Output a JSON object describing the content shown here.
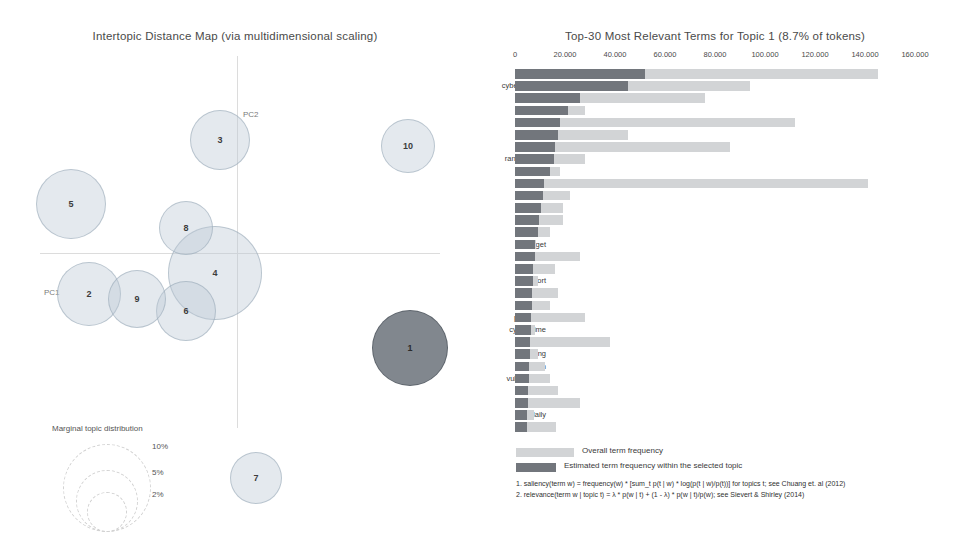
{
  "left": {
    "title": "Intertopic Distance Map (via multidimensional scaling)",
    "axis_labels": {
      "pc1": "PC1",
      "pc2": "PC2"
    },
    "marginal_legend": {
      "title": "Marginal topic distribution",
      "percents": [
        "2%",
        "5%",
        "10%"
      ]
    },
    "topics": [
      {
        "id": "1",
        "label": "1",
        "x": 410,
        "y": 300,
        "r": 38,
        "selected": true
      },
      {
        "id": "2",
        "label": "2",
        "x": 89,
        "y": 246,
        "r": 32,
        "selected": false
      },
      {
        "id": "3",
        "label": "3",
        "x": 220,
        "y": 92,
        "r": 30,
        "selected": false
      },
      {
        "id": "4",
        "label": "4",
        "x": 215,
        "y": 225,
        "r": 47,
        "selected": false
      },
      {
        "id": "5",
        "label": "5",
        "x": 71,
        "y": 156,
        "r": 35,
        "selected": false
      },
      {
        "id": "6",
        "label": "6",
        "x": 186,
        "y": 263,
        "r": 30,
        "selected": false
      },
      {
        "id": "7",
        "label": "7",
        "x": 256,
        "y": 430,
        "r": 26,
        "selected": false
      },
      {
        "id": "8",
        "label": "8",
        "x": 186,
        "y": 180,
        "r": 27,
        "selected": false
      },
      {
        "id": "9",
        "label": "9",
        "x": 137,
        "y": 251,
        "r": 29,
        "selected": false
      },
      {
        "id": "10",
        "label": "10",
        "x": 408,
        "y": 98,
        "r": 27,
        "selected": false
      }
    ]
  },
  "right": {
    "title": "Top-30 Most Relevant Terms for Topic 1 (8.7% of tokens)",
    "legend": {
      "overall": "Overall term frequency",
      "estimated": "Estimated term frequency within the selected topic"
    },
    "formulas": [
      "1. saliency(term w) = frequency(w) * [sum_t p(t | w) * log(p(t | w)/p(t))] for topics t; see Chuang et. al (2012)",
      "2. relevance(term w | topic t) = λ * p(w | t) + (1 - λ) * p(w | t)/p(w); see Sievert & Shirley (2014)"
    ]
  },
  "chart_data": {
    "type": "bar",
    "title": "Top-30 Most Relevant Terms for Topic 1 (8.7% of tokens)",
    "orientation": "horizontal",
    "xlabel": "",
    "ylabel": "",
    "xlim": [
      0,
      160000
    ],
    "xticks": [
      0,
      20000,
      40000,
      60000,
      80000,
      100000,
      120000,
      140000,
      160000
    ],
    "xticklabels": [
      "0",
      "20.000",
      "40.000",
      "60.000",
      "80.000",
      "100.000",
      "120.000",
      "140.000",
      "160.000"
    ],
    "grid": false,
    "legend_position": "bottom",
    "categories": [
      "security",
      "cybersecurity",
      "cyber",
      "infosec",
      "attack",
      "data",
      "hack",
      "ransomware",
      "new",
      "malware",
      "hacker",
      "threat",
      "breach",
      "late",
      "target",
      "news",
      "cloud",
      "report",
      "risk",
      "user",
      "password",
      "cybercrime",
      "privacy",
      "phishing",
      "million",
      "vulnerability",
      "company",
      "thanks",
      "daily",
      "google"
    ],
    "series": [
      {
        "name": "Overall term frequency",
        "values": [
          145000,
          94000,
          76000,
          28000,
          112000,
          45000,
          86000,
          28000,
          18000,
          141000,
          22000,
          19000,
          19000,
          14000,
          8500,
          26000,
          16000,
          9000,
          17000,
          14000,
          28000,
          8000,
          38000,
          9000,
          12000,
          14000,
          17000,
          26000,
          7500,
          16500
        ]
      },
      {
        "name": "Estimated term frequency within the selected topic",
        "values": [
          52000,
          45000,
          26000,
          21000,
          18000,
          17000,
          16000,
          15500,
          14000,
          11500,
          11000,
          10500,
          9500,
          9000,
          8000,
          7800,
          7200,
          7000,
          6800,
          6600,
          6400,
          6200,
          6000,
          5800,
          5600,
          5400,
          5200,
          5000,
          4800,
          4600
        ]
      }
    ]
  }
}
